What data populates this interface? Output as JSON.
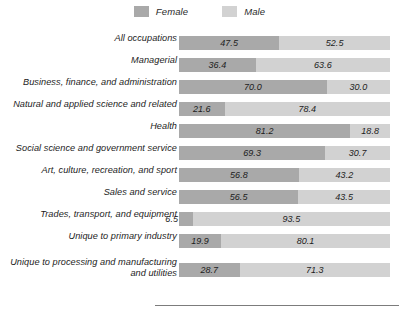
{
  "legend": {
    "entries": [
      {
        "label": "Female",
        "color": "#a9a9a9",
        "icon": "legend-swatch-icon"
      },
      {
        "label": "Male",
        "color": "#d2d2d2",
        "icon": "legend-swatch-icon"
      }
    ]
  },
  "colors": {
    "female": "#a9a9a9",
    "male": "#d2d2d2",
    "text": "#1c1c1c",
    "rule": "#7c7c7c",
    "background": "#ffffff"
  },
  "chart_data": {
    "type": "bar",
    "title": "",
    "subtitle": "",
    "xlabel": "",
    "ylabel": "",
    "orientation": "horizontal",
    "stacked": true,
    "normalized": true,
    "xlim": [
      0,
      100
    ],
    "grid": false,
    "legend_position": "top-center",
    "categories": [
      "All occupations",
      "Managerial",
      "Business, finance, and administration",
      "Natural and applied science and related",
      "Health",
      "Social science and government service",
      "Art, culture, recreation, and sport",
      "Sales and service",
      "Trades, transport, and equipment",
      "Unique to primary industry",
      "Unique to processing and manufacturing\nand utilities"
    ],
    "series": [
      {
        "name": "Female",
        "color": "#a9a9a9",
        "values": [
          47.5,
          36.4,
          70.0,
          21.6,
          81.2,
          69.3,
          56.8,
          56.5,
          6.5,
          19.9,
          28.7
        ]
      },
      {
        "name": "Male",
        "color": "#d2d2d2",
        "values": [
          52.5,
          63.6,
          30.0,
          78.4,
          18.8,
          30.7,
          43.2,
          43.5,
          93.5,
          80.1,
          71.3
        ]
      }
    ],
    "value_labels": [
      {
        "female": "47.5",
        "male": "52.5"
      },
      {
        "female": "36.4",
        "male": "63.6"
      },
      {
        "female": "70.0",
        "male": "30.0"
      },
      {
        "female": "21.6",
        "male": "78.4"
      },
      {
        "female": "81.2",
        "male": "18.8"
      },
      {
        "female": "69.3",
        "male": "30.7"
      },
      {
        "female": "56.8",
        "male": "43.2"
      },
      {
        "female": "56.5",
        "male": "43.5"
      },
      {
        "female": "6.5",
        "male": "93.5"
      },
      {
        "female": "19.9",
        "male": "80.1"
      },
      {
        "female": "28.7",
        "male": "71.3"
      }
    ]
  }
}
